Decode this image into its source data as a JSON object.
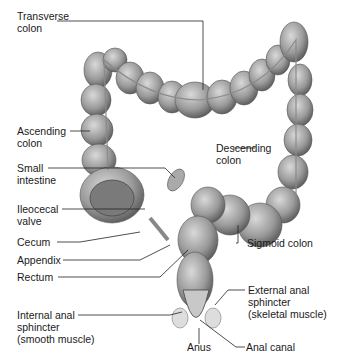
{
  "diagram": {
    "labels": {
      "transverse_colon": "Transverse\ncolon",
      "ascending_colon": "Ascending\ncolon",
      "small_intestine": "Small\nintestine",
      "ileocecal_valve": "Ileocecal\nvalve",
      "cecum": "Cecum",
      "appendix": "Appendix",
      "rectum": "Rectum",
      "internal_anal_sphincter": "Internal anal\nsphincter\n(smooth muscle)",
      "descending_colon": "Descending\ncolon",
      "sigmoid_colon": "Sigmoid colon",
      "external_anal_sphincter": "External anal\nsphincter\n(skeletal muscle)",
      "anus": "Anus",
      "anal_canal": "Anal canal"
    },
    "colors": {
      "tissue_light": "#bdbdbd",
      "tissue_dark": "#5a5a5a",
      "leader": "#222222"
    }
  }
}
